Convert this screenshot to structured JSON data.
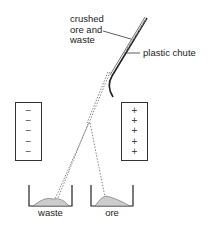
{
  "diagram": {
    "labels": {
      "feed": [
        "crushed",
        "ore and",
        "waste"
      ],
      "chute": "plastic chute"
    },
    "plates": {
      "negative": {
        "signs": [
          "−",
          "−",
          "−",
          "−",
          "−"
        ]
      },
      "positive": {
        "signs": [
          "+",
          "+",
          "+",
          "+",
          "+"
        ]
      }
    },
    "bins": {
      "waste": "waste",
      "ore": "ore"
    }
  }
}
